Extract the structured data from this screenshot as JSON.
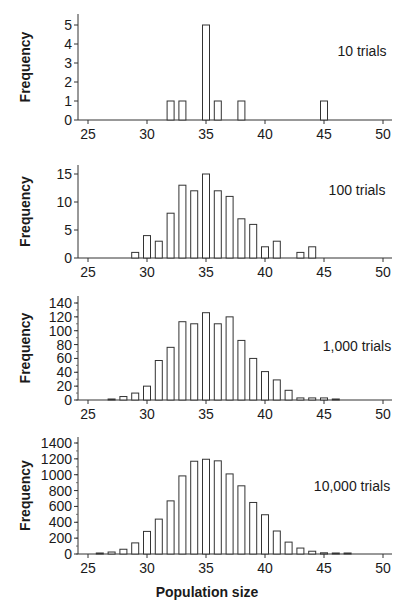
{
  "figure": {
    "shared_xlabel": "Population size",
    "ylabel": "Frequency"
  },
  "chart_data": [
    {
      "type": "bar",
      "title": "10 trials",
      "annotation": "10 trials",
      "xlabel": "Population size",
      "ylabel": "Frequency",
      "xlim": [
        24,
        51
      ],
      "ylim": [
        0,
        5
      ],
      "xticks": [
        25,
        30,
        35,
        40,
        45,
        50
      ],
      "yticks": [
        0,
        1,
        2,
        3,
        4,
        5
      ],
      "x": [
        32,
        33,
        35,
        36,
        38,
        45
      ],
      "values": [
        1,
        1,
        5,
        1,
        1,
        1
      ],
      "grid": false
    },
    {
      "type": "bar",
      "title": "100 trials",
      "annotation": "100 trials",
      "xlabel": "Population size",
      "ylabel": "Frequency",
      "xlim": [
        24,
        51
      ],
      "ylim": [
        0,
        16
      ],
      "xticks": [
        25,
        30,
        35,
        40,
        45,
        50
      ],
      "yticks": [
        0,
        5,
        10,
        15
      ],
      "x": [
        29,
        30,
        31,
        32,
        33,
        34,
        35,
        36,
        37,
        38,
        39,
        40,
        41,
        43,
        44
      ],
      "values": [
        1,
        4,
        3,
        8,
        13,
        12,
        15,
        12,
        11,
        7,
        6,
        2,
        3,
        1,
        2
      ],
      "grid": false
    },
    {
      "type": "bar",
      "title": "1,000 trials",
      "annotation": "1,000 trials",
      "xlabel": "Population size",
      "ylabel": "Frequency",
      "xlim": [
        24,
        51
      ],
      "ylim": [
        0,
        145
      ],
      "xticks": [
        25,
        30,
        35,
        40,
        45,
        50
      ],
      "yticks": [
        0,
        20,
        40,
        60,
        80,
        100,
        120,
        140
      ],
      "x": [
        27,
        28,
        29,
        30,
        31,
        32,
        33,
        34,
        35,
        36,
        37,
        38,
        39,
        40,
        41,
        42,
        43,
        44,
        45,
        46
      ],
      "values": [
        1,
        5,
        10,
        20,
        57,
        76,
        113,
        110,
        126,
        110,
        120,
        86,
        60,
        41,
        29,
        14,
        3,
        3,
        3,
        1
      ],
      "grid": false
    },
    {
      "type": "bar",
      "title": "10,000 trials",
      "annotation": "10,000 trials",
      "xlabel": "Population size",
      "ylabel": "Frequency",
      "xlim": [
        24,
        51
      ],
      "ylim": [
        0,
        1450
      ],
      "xticks": [
        25,
        30,
        35,
        40,
        45,
        50
      ],
      "yticks": [
        0,
        200,
        400,
        600,
        800,
        1000,
        1200,
        1400
      ],
      "x": [
        26,
        27,
        28,
        29,
        30,
        31,
        32,
        33,
        34,
        35,
        36,
        37,
        38,
        39,
        40,
        41,
        42,
        43,
        44,
        45,
        46,
        47
      ],
      "values": [
        10,
        25,
        60,
        140,
        285,
        440,
        670,
        985,
        1170,
        1195,
        1175,
        1010,
        860,
        650,
        495,
        290,
        150,
        75,
        35,
        15,
        8,
        2
      ],
      "grid": false
    }
  ]
}
